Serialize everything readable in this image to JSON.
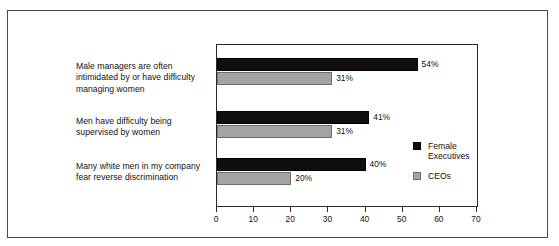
{
  "chart_data": {
    "type": "bar",
    "orientation": "horizontal",
    "title": "",
    "subtitle": "",
    "xlabel": "",
    "ylabel": "",
    "xlim": [
      0,
      70
    ],
    "xticks": [
      0,
      10,
      20,
      30,
      40,
      50,
      60,
      70
    ],
    "xtick_labels": [
      "0",
      "10",
      "20",
      "30",
      "40",
      "50",
      "60",
      "70"
    ],
    "grid": false,
    "legend_position": "right",
    "categories": [
      "Male managers are often\nintimidated by or have\ndifficulty managing women",
      "Men have difficulty being\nsupervised by women",
      "Many white men in my\ncompany fear reverse\ndiscrimination"
    ],
    "series": [
      {
        "name": "Female\nExecutives",
        "color": "#120d0d",
        "values": [
          54,
          41,
          40
        ],
        "value_labels": [
          "54%",
          "41%",
          "40%"
        ]
      },
      {
        "name": "CEOs",
        "color": "#a3a3a3",
        "values": [
          31,
          31,
          20
        ],
        "value_labels": [
          "31%",
          "31%",
          "20%"
        ]
      }
    ]
  },
  "legend": {
    "entries": [
      {
        "label": "Female\nExecutives",
        "color": "#120d0d"
      },
      {
        "label": "CEOs",
        "color": "#a3a3a3"
      }
    ]
  },
  "axis": {
    "ticks": [
      "0",
      "10",
      "20",
      "30",
      "40",
      "50",
      "60",
      "70"
    ]
  },
  "colors": {
    "series_female_executives": "#120d0d",
    "series_ceos": "#a3a3a3",
    "frame": "#4a4a4a",
    "plot_border": "#2a2a2a",
    "text": "#111111",
    "background": "#ffffff"
  }
}
